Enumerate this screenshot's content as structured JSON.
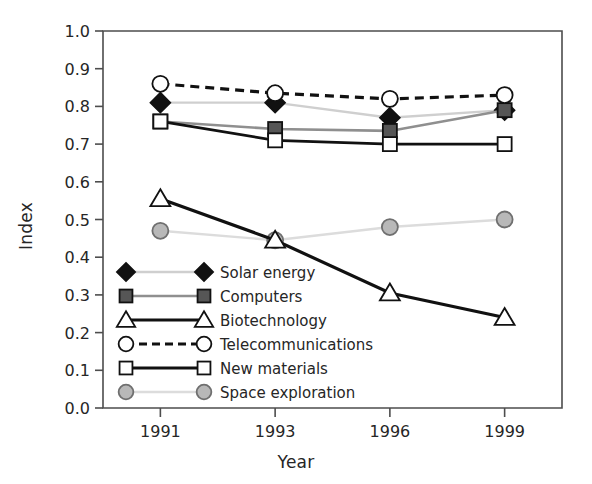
{
  "chart_data": {
    "type": "line",
    "title": "",
    "xlabel": "Year",
    "ylabel": "Index",
    "categories": [
      "1991",
      "1993",
      "1996",
      "1999"
    ],
    "ylim": [
      0.0,
      1.0
    ],
    "ytick_labels": [
      "0.0",
      "0.1",
      "0.2",
      "0.3",
      "0.4",
      "0.5",
      "0.6",
      "0.7",
      "0.8",
      "0.9",
      "1.0"
    ],
    "ytick_values": [
      0.0,
      0.1,
      0.2,
      0.3,
      0.4,
      0.5,
      0.6,
      0.7,
      0.8,
      0.9,
      1.0
    ],
    "grid": false,
    "legend_position": "inside-lower-left",
    "series": [
      {
        "name": "Solar energy",
        "values": [
          0.81,
          0.81,
          0.77,
          0.79
        ],
        "marker": "diamond",
        "marker_fill": "#111111",
        "marker_edge": "#111111",
        "line_color": "#cfcfcf",
        "line_style": "solid",
        "line_width": 2.4
      },
      {
        "name": "Computers",
        "values": [
          0.76,
          0.74,
          0.735,
          0.79
        ],
        "marker": "square",
        "marker_fill": "#565656",
        "marker_edge": "#111111",
        "line_color": "#8f8f8f",
        "line_style": "solid",
        "line_width": 2.6
      },
      {
        "name": "Biotechnology",
        "values": [
          0.555,
          0.445,
          0.305,
          0.24
        ],
        "marker": "triangle",
        "marker_fill": "#ffffff",
        "marker_edge": "#111111",
        "line_color": "#111111",
        "line_style": "solid",
        "line_width": 3.2
      },
      {
        "name": "Telecommunications",
        "values": [
          0.86,
          0.835,
          0.82,
          0.83
        ],
        "marker": "circle",
        "marker_fill": "#ffffff",
        "marker_edge": "#111111",
        "line_color": "#111111",
        "line_style": "dashed",
        "line_width": 3.2
      },
      {
        "name": "New materials",
        "values": [
          0.76,
          0.71,
          0.7,
          0.7
        ],
        "marker": "square",
        "marker_fill": "#ffffff",
        "marker_edge": "#111111",
        "line_color": "#111111",
        "line_style": "solid",
        "line_width": 2.8
      },
      {
        "name": "Space exploration",
        "values": [
          0.47,
          0.445,
          0.48,
          0.5
        ],
        "marker": "circle",
        "marker_fill": "#b8b8b8",
        "marker_edge": "#6f6f6f",
        "line_color": "#dcdcdc",
        "line_style": "solid",
        "line_width": 2.4
      }
    ]
  },
  "axes": {
    "frame_color": "#4d4d4d",
    "plot_left": 103,
    "plot_right": 562,
    "plot_top": 31,
    "plot_bottom": 408
  }
}
